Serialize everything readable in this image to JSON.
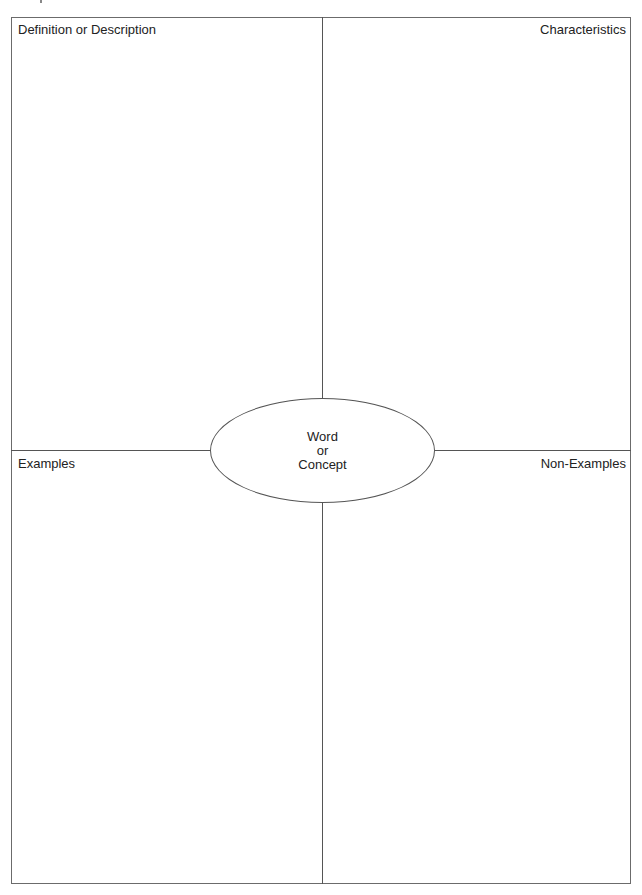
{
  "diagram": {
    "type": "frayer-model",
    "quadrants": {
      "top_left": "Definition or Description",
      "top_right": "Characteristics",
      "bottom_left": "Examples",
      "bottom_right": "Non-Examples"
    },
    "center": {
      "line1": "Word",
      "line2": "or",
      "line3": "Concept"
    },
    "colors": {
      "line": "#555555",
      "text": "#222222",
      "background": "#ffffff"
    }
  }
}
